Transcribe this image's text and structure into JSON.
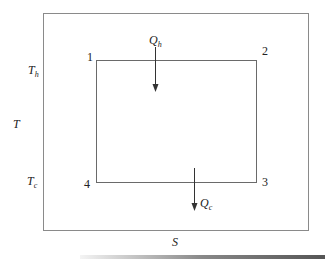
{
  "diagram": {
    "axes": {
      "y_label": "T",
      "x_label": "S",
      "y_ticks": [
        {
          "label": "T",
          "subscript": "h"
        },
        {
          "label": "T",
          "subscript": "c"
        }
      ]
    },
    "states": [
      "1",
      "2",
      "3",
      "4"
    ],
    "heat_flows": [
      {
        "label": "Q",
        "subscript": "h",
        "direction": "down",
        "position": "top edge"
      },
      {
        "label": "Q",
        "subscript": "c",
        "direction": "down",
        "position": "bottom edge"
      }
    ],
    "colors": {
      "line": "#7a7a7a",
      "text": "#222222"
    }
  }
}
